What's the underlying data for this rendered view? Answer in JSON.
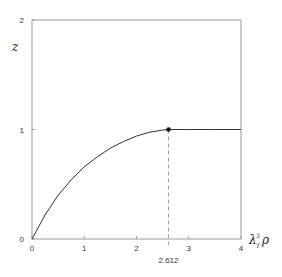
{
  "chart_data": {
    "type": "line",
    "title": "",
    "xlabel": "λ_T³ ρ",
    "xlabel_main": "λ",
    "xlabel_sub": "T",
    "xlabel_sup": "3",
    "xlabel_tail": "ρ",
    "ylabel": "z",
    "xlim": [
      0,
      4
    ],
    "ylim": [
      0,
      2
    ],
    "x_ticks": [
      0,
      1,
      2,
      3,
      4
    ],
    "x_tick_labels": [
      "0",
      "1",
      "2",
      "3",
      "4"
    ],
    "y_ticks": [
      0,
      1,
      2
    ],
    "y_tick_labels": [
      "0",
      "1",
      "2"
    ],
    "grid": false,
    "series": [
      {
        "name": "z(λ³ρ)",
        "description": "z rises from 0 (inverse of g_{3/2}(z)=λ³ρ) to 1 at λ³ρ=2.612, then stays at 1",
        "x": [
          0,
          0.25,
          0.5,
          0.75,
          1.0,
          1.25,
          1.5,
          1.75,
          2.0,
          2.25,
          2.5,
          2.612,
          3.0,
          3.5,
          4.0
        ],
        "y": [
          0,
          0.22,
          0.4,
          0.54,
          0.66,
          0.75,
          0.83,
          0.89,
          0.94,
          0.975,
          0.995,
          1.0,
          1.0,
          1.0,
          1.0
        ]
      }
    ],
    "annotations": [
      {
        "type": "point",
        "x": 2.612,
        "y": 1
      },
      {
        "type": "vline-dashed",
        "x": 2.612,
        "from_y": 0,
        "to_y": 1,
        "label": "2.612"
      }
    ],
    "critical_label": "2.612"
  }
}
